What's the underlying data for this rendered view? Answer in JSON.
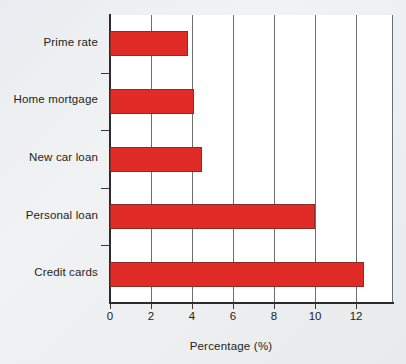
{
  "chart_data": {
    "type": "bar",
    "orientation": "horizontal",
    "title": "",
    "subtitle": "",
    "xlabel": "Percentage (%)",
    "ylabel": "",
    "categories": [
      "Prime rate",
      "Home mortgage",
      "New car loan",
      "Personal loan",
      "Credit cards"
    ],
    "values": [
      3.8,
      4.1,
      4.5,
      10.0,
      12.4
    ],
    "series": [
      {
        "name": "Percentage",
        "values": [
          3.8,
          4.1,
          4.5,
          10.0,
          12.4
        ]
      }
    ],
    "xlim": [
      0,
      13.8
    ],
    "ylim": null,
    "xticks": [
      0,
      2,
      4,
      6,
      8,
      10,
      12
    ],
    "xtick_labels": [
      "0",
      "2",
      "4",
      "6",
      "8",
      "10",
      "12"
    ],
    "grid": "vertical",
    "legend": "none",
    "bar_color": "#e12b26",
    "bar_edge_color": "#8f2b27",
    "plot_background": "#ffffff",
    "figure_background": "#eceef0",
    "axis_color": "#2d2a2b",
    "gridline_color": "#6d6e71"
  },
  "axis": {
    "x_title": "Percentage (%)",
    "tick_labels": [
      "0",
      "2",
      "4",
      "6",
      "8",
      "10",
      "12"
    ]
  },
  "bars": [
    {
      "label": "Prime rate",
      "value": 3.8
    },
    {
      "label": "Home mortgage",
      "value": 4.1
    },
    {
      "label": "New car loan",
      "value": 4.5
    },
    {
      "label": "Personal loan",
      "value": 10.0
    },
    {
      "label": "Credit cards",
      "value": 12.4
    }
  ]
}
